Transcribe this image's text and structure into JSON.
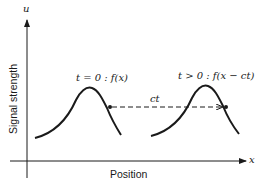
{
  "diagram": {
    "axes": {
      "y_symbol": "u",
      "x_symbol": "x",
      "y_label": "Signal strength",
      "x_label": "Position"
    },
    "pulses": [
      {
        "id": "initial",
        "label": "t = 0 : f(x)"
      },
      {
        "id": "shifted",
        "label": "t > 0 : f(x − ct)"
      }
    ],
    "shift": {
      "label": "ct",
      "style": "dashed-arrow"
    },
    "colors": {
      "ink": "#1a1a1a",
      "background": "#ffffff"
    }
  }
}
